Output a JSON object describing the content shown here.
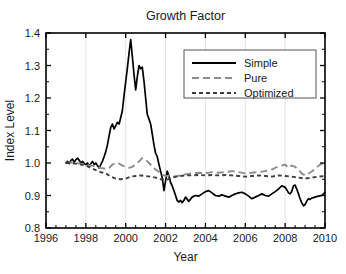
{
  "chart_data": {
    "type": "line",
    "title": "Growth Factor",
    "xlabel": "Year",
    "ylabel": "Index Level",
    "xlim": [
      1996,
      2010
    ],
    "ylim": [
      0.8,
      1.4
    ],
    "xticks": [
      1996,
      1998,
      2000,
      2002,
      2004,
      2006,
      2008,
      2010
    ],
    "xtick_labels": [
      "1996",
      "1998",
      "2000",
      "2002",
      "2004",
      "2006",
      "2008",
      "2010"
    ],
    "yticks": [
      0.8,
      0.9,
      1.0,
      1.1,
      1.2,
      1.3,
      1.4
    ],
    "ytick_labels": [
      "0.8",
      "0.9",
      "1.0",
      "1.1",
      "1.2",
      "1.3",
      "1.4"
    ],
    "x_minor_step": 0.5,
    "y_minor_step": 0.05,
    "grid": "vertical-major-faint",
    "legend_position": "top-right-inside",
    "series": [
      {
        "name": "Simple",
        "style": "solid",
        "color": "#000000",
        "x": [
          1997.0,
          1997.08,
          1997.17,
          1997.25,
          1997.33,
          1997.42,
          1997.5,
          1997.58,
          1997.67,
          1997.75,
          1997.83,
          1997.92,
          1998.0,
          1998.08,
          1998.17,
          1998.25,
          1998.33,
          1998.42,
          1998.5,
          1998.58,
          1998.67,
          1998.75,
          1998.83,
          1998.92,
          1999.0,
          1999.08,
          1999.17,
          1999.25,
          1999.33,
          1999.42,
          1999.5,
          1999.58,
          1999.67,
          1999.75,
          1999.83,
          1999.92,
          2000.0,
          2000.08,
          2000.17,
          2000.25,
          2000.33,
          2000.42,
          2000.5,
          2000.58,
          2000.67,
          2000.75,
          2000.83,
          2000.92,
          2001.0,
          2001.08,
          2001.17,
          2001.25,
          2001.33,
          2001.42,
          2001.5,
          2001.58,
          2001.67,
          2001.75,
          2001.83,
          2001.92,
          2002.0,
          2002.08,
          2002.17,
          2002.25,
          2002.33,
          2002.42,
          2002.5,
          2002.58,
          2002.67,
          2002.75,
          2002.83,
          2002.92,
          2003.0,
          2003.17,
          2003.33,
          2003.5,
          2003.67,
          2003.83,
          2004.0,
          2004.17,
          2004.33,
          2004.5,
          2004.67,
          2004.83,
          2005.0,
          2005.17,
          2005.33,
          2005.5,
          2005.67,
          2005.83,
          2006.0,
          2006.17,
          2006.33,
          2006.5,
          2006.67,
          2006.83,
          2007.0,
          2007.17,
          2007.33,
          2007.5,
          2007.67,
          2007.83,
          2008.0,
          2008.08,
          2008.17,
          2008.25,
          2008.33,
          2008.42,
          2008.5,
          2008.58,
          2008.67,
          2008.75,
          2008.83,
          2008.92,
          2009.0,
          2009.08,
          2009.17,
          2009.25,
          2009.33,
          2009.5,
          2009.67,
          2009.83,
          2010.0
        ],
        "y": [
          1.0,
          1.005,
          0.998,
          1.008,
          1.012,
          1.003,
          1.01,
          1.015,
          1.008,
          1.0,
          1.005,
          0.998,
          0.995,
          1.0,
          0.99,
          0.998,
          1.005,
          0.995,
          1.0,
          0.992,
          0.985,
          0.995,
          1.005,
          1.02,
          1.035,
          1.055,
          1.085,
          1.11,
          1.12,
          1.105,
          1.115,
          1.125,
          1.12,
          1.14,
          1.16,
          1.21,
          1.25,
          1.29,
          1.34,
          1.38,
          1.33,
          1.27,
          1.225,
          1.265,
          1.3,
          1.29,
          1.295,
          1.25,
          1.2,
          1.15,
          1.135,
          1.12,
          1.09,
          1.055,
          1.03,
          1.02,
          0.995,
          0.975,
          0.955,
          0.915,
          0.945,
          0.975,
          0.96,
          0.94,
          0.93,
          0.915,
          0.9,
          0.885,
          0.88,
          0.885,
          0.878,
          0.885,
          0.895,
          0.882,
          0.895,
          0.9,
          0.898,
          0.905,
          0.912,
          0.915,
          0.908,
          0.9,
          0.898,
          0.902,
          0.898,
          0.895,
          0.9,
          0.905,
          0.908,
          0.91,
          0.905,
          0.898,
          0.89,
          0.895,
          0.9,
          0.905,
          0.9,
          0.898,
          0.905,
          0.912,
          0.92,
          0.93,
          0.925,
          0.918,
          0.908,
          0.905,
          0.912,
          0.93,
          0.932,
          0.92,
          0.905,
          0.89,
          0.878,
          0.868,
          0.872,
          0.882,
          0.89,
          0.888,
          0.892,
          0.895,
          0.898,
          0.9,
          0.91
        ]
      },
      {
        "name": "Pure",
        "style": "long-dash",
        "color": "#8c8c8c",
        "x": [
          1997.0,
          1997.25,
          1997.5,
          1997.75,
          1998.0,
          1998.25,
          1998.5,
          1998.75,
          1999.0,
          1999.17,
          1999.33,
          1999.5,
          1999.67,
          1999.83,
          2000.0,
          2000.17,
          2000.33,
          2000.5,
          2000.67,
          2000.83,
          2001.0,
          2001.17,
          2001.33,
          2001.5,
          2001.67,
          2001.83,
          2002.0,
          2002.25,
          2002.5,
          2002.75,
          2003.0,
          2003.33,
          2003.67,
          2004.0,
          2004.33,
          2004.67,
          2005.0,
          2005.33,
          2005.67,
          2006.0,
          2006.33,
          2006.67,
          2007.0,
          2007.33,
          2007.67,
          2008.0,
          2008.17,
          2008.33,
          2008.5,
          2008.67,
          2008.83,
          2009.0,
          2009.25,
          2009.5,
          2009.75,
          2010.0
        ],
        "y": [
          1.0,
          1.002,
          1.0,
          0.998,
          0.995,
          0.992,
          0.99,
          0.985,
          0.982,
          0.985,
          0.995,
          1.0,
          0.998,
          0.992,
          0.988,
          0.985,
          0.988,
          0.995,
          1.005,
          1.015,
          1.01,
          1.0,
          0.99,
          0.98,
          0.972,
          0.965,
          0.96,
          0.962,
          0.958,
          0.962,
          0.965,
          0.968,
          0.97,
          0.968,
          0.972,
          0.97,
          0.972,
          0.975,
          0.972,
          0.968,
          0.97,
          0.972,
          0.975,
          0.98,
          0.99,
          0.995,
          0.985,
          0.992,
          0.988,
          0.98,
          0.968,
          0.962,
          0.97,
          0.982,
          0.995,
          1.0
        ]
      },
      {
        "name": "Optimized",
        "style": "short-dash",
        "color": "#3d3d3d",
        "x": [
          1997.0,
          1997.25,
          1997.5,
          1997.75,
          1998.0,
          1998.25,
          1998.5,
          1998.75,
          1999.0,
          1999.25,
          1999.5,
          1999.75,
          2000.0,
          2000.25,
          2000.5,
          2000.75,
          2001.0,
          2001.25,
          2001.5,
          2001.75,
          2002.0,
          2002.25,
          2002.5,
          2002.75,
          2003.0,
          2003.33,
          2003.67,
          2004.0,
          2004.33,
          2004.67,
          2005.0,
          2005.33,
          2005.67,
          2006.0,
          2006.33,
          2006.67,
          2007.0,
          2007.33,
          2007.67,
          2008.0,
          2008.33,
          2008.67,
          2009.0,
          2009.33,
          2009.67,
          2010.0
        ],
        "y": [
          1.0,
          1.0,
          0.998,
          0.995,
          0.992,
          0.985,
          0.978,
          0.972,
          0.968,
          0.958,
          0.952,
          0.95,
          0.952,
          0.958,
          0.96,
          0.962,
          0.96,
          0.958,
          0.955,
          0.95,
          0.948,
          0.952,
          0.958,
          0.96,
          0.962,
          0.962,
          0.963,
          0.962,
          0.963,
          0.962,
          0.963,
          0.962,
          0.96,
          0.958,
          0.96,
          0.962,
          0.96,
          0.958,
          0.962,
          0.96,
          0.958,
          0.955,
          0.952,
          0.955,
          0.958,
          0.96
        ]
      }
    ]
  },
  "colors": {
    "simple": "#000000",
    "pure": "#8c8c8c",
    "optimized": "#3d3d3d",
    "axis": "#000000",
    "grid": "#e3e3e3",
    "text": "#1a1a1a"
  }
}
